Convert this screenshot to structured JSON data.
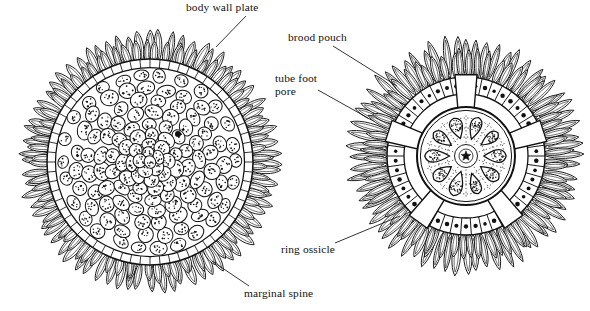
{
  "figure": {
    "background_color": "#ffffff",
    "ink_color": "#111111",
    "specimens": [
      {
        "id": "left-specimen",
        "view": "external dorsal view",
        "center": [
          150,
          162
        ],
        "body_radius": 103,
        "spine_tip_radius": 131,
        "marginal_spine_count": 72,
        "plate_texture": "rounded body wall plates filled with stipple dots",
        "plate_count": 150
      },
      {
        "id": "right-specimen",
        "view": "internal dorsal view showing brood pouches",
        "center": [
          466,
          156
        ],
        "body_radius": 79,
        "spine_tip_radius": 124,
        "marginal_spine_count": 64,
        "brood_pouch_count": 10,
        "tube_foot_pore_count": 96,
        "ring_ossicle_radius": 60,
        "interradial_plate_count": 5
      }
    ]
  },
  "labels": [
    {
      "key": "body_wall_plate",
      "text": "body wall plate",
      "target_specimen": "left-specimen",
      "leader": {
        "x1": 246,
        "y1": 16,
        "x2": 216,
        "y2": 47
      }
    },
    {
      "key": "brood_pouch",
      "text": "brood pouch",
      "target_specimen": "right-specimen",
      "leader": {
        "x1": 333,
        "y1": 46,
        "x2": 397,
        "y2": 86
      }
    },
    {
      "key": "tube_foot_pore",
      "text": "tube foot\npore",
      "line1": "tube foot",
      "line2": "pore",
      "target_specimen": "right-specimen",
      "leader": {
        "x1": 318,
        "y1": 90,
        "x2": 368,
        "y2": 118
      }
    },
    {
      "key": "ring_ossicle",
      "text": "ring ossicle",
      "target_specimen": "right-specimen",
      "leader": {
        "x1": 335,
        "y1": 243,
        "x2": 400,
        "y2": 216
      }
    },
    {
      "key": "marginal_spine",
      "text": "marginal spine",
      "target_specimen": "left-specimen",
      "leader": {
        "x1": 249,
        "y1": 286,
        "x2": 212,
        "y2": 261
      }
    }
  ]
}
